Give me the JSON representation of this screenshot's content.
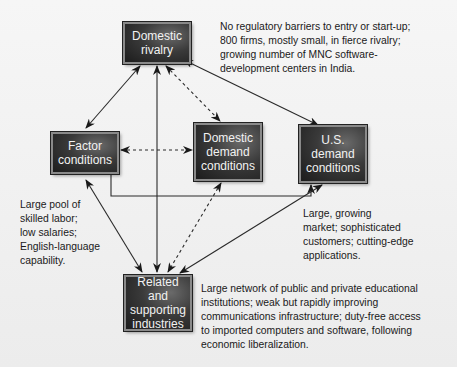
{
  "diagram": {
    "type": "porter-diamond",
    "boxes": {
      "domestic_rivalry": {
        "line1": "Domestic",
        "line2": "rivalry"
      },
      "factor_conditions": {
        "line1": "Factor",
        "line2": "conditions"
      },
      "domestic_demand": {
        "line1": "Domestic",
        "line2": "demand",
        "line3": "conditions"
      },
      "us_demand": {
        "line1": "U.S.",
        "line2": "demand",
        "line3": "conditions"
      },
      "related_supporting": {
        "line1": "Related and",
        "line2": "supporting",
        "line3": "industries"
      }
    },
    "notes": {
      "rivalry": [
        "No regulatory barriers to entry or start-up;",
        "800 firms, mostly small, in fierce rivalry;",
        "growing number of MNC software-",
        "development centers in India."
      ],
      "factor": [
        "Large pool of",
        "skilled labor;",
        "low salaries;",
        "English-language",
        "capability."
      ],
      "us_demand": [
        "Large, growing",
        "market; sophisticated",
        "customers; cutting-edge",
        "applications."
      ],
      "related": [
        "Large network of public and private educational",
        "institutions; weak but rapidly improving",
        "communications infrastructure; duty-free access",
        "to imported computers and software, following",
        "economic liberalization."
      ]
    },
    "links": [
      {
        "from": "Domestic rivalry",
        "to": "Factor conditions",
        "style": "solid",
        "bidirectional": true
      },
      {
        "from": "Domestic rivalry",
        "to": "Domestic demand conditions",
        "style": "dashed",
        "bidirectional": true
      },
      {
        "from": "Domestic rivalry",
        "to": "U.S. demand conditions",
        "style": "solid",
        "bidirectional": true
      },
      {
        "from": "Domestic rivalry",
        "to": "Related and supporting industries",
        "style": "solid",
        "bidirectional": true
      },
      {
        "from": "Factor conditions",
        "to": "Domestic demand conditions",
        "style": "dashed",
        "bidirectional": true
      },
      {
        "from": "Factor conditions",
        "to": "U.S. demand conditions",
        "style": "solid",
        "bidirectional": true
      },
      {
        "from": "Factor conditions",
        "to": "Related and supporting industries",
        "style": "solid",
        "bidirectional": true
      },
      {
        "from": "Domestic demand conditions",
        "to": "Related and supporting industries",
        "style": "dashed",
        "bidirectional": true
      },
      {
        "from": "U.S. demand conditions",
        "to": "Related and supporting industries",
        "style": "solid",
        "bidirectional": true
      }
    ],
    "colors": {
      "box_fill": "#2e2e2e",
      "box_text": "#f2f2f2",
      "arrow": "#222222",
      "background": "#f0f0f0"
    }
  }
}
